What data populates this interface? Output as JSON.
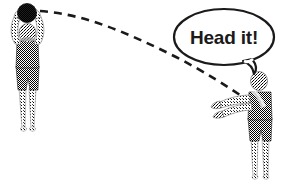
{
  "illustration": {
    "title": "Soccer throw-in coaching illustration",
    "background_color": "#ffffff",
    "ink_color": "#1a1a1a",
    "figures": [
      {
        "id": "thrower",
        "name": "left-player-thrower",
        "description": "Player with both arms raised overhead holding a ball, preparing a throw-in",
        "position": "left",
        "shirt_color": "#3a3a3a",
        "skin_color": "#b0b0b0",
        "legs_color": "#c9c9c9"
      },
      {
        "id": "receiver",
        "name": "right-player-receiver",
        "description": "Player standing with both arms extended forward, about to head the ball",
        "position": "right",
        "shirt_color": "#3a3a3a",
        "skin_color": "#b0b0b0",
        "legs_color": "#c9c9c9"
      }
    ],
    "ball": {
      "name": "soccer-ball",
      "color": "#262626",
      "label": ""
    },
    "trajectory": {
      "name": "ball-trajectory-dashed-arc",
      "style": "dashed",
      "color": "#1a1a1a",
      "description": "Dashed arc from the thrown ball to the receiver's hands"
    },
    "speech_bubble": {
      "name": "speech-bubble",
      "text": "Head it!",
      "outline_color": "#1a1a1a",
      "fill_color": "#ffffff",
      "tail_direction": "down-left"
    }
  }
}
